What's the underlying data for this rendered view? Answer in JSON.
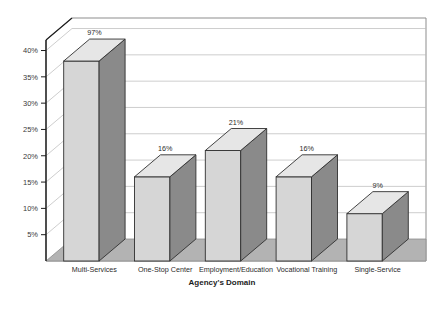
{
  "chart_data": {
    "type": "bar",
    "title": "",
    "xlabel": "Agency's Domain",
    "ylabel": "",
    "categories": [
      "Multi-Services",
      "One-Stop Center",
      "Employment/Education",
      "Vocational Training",
      "Single-Service"
    ],
    "values": [
      38,
      16,
      21,
      16,
      9
    ],
    "data_labels": [
      "97%",
      "16%",
      "21%",
      "16%",
      "9%"
    ],
    "ytick_labels": [
      "5%",
      "10%",
      "15%",
      "20%",
      "25%",
      "30%",
      "35%",
      "40%"
    ],
    "ytick_values": [
      5,
      10,
      15,
      20,
      25,
      30,
      35,
      40
    ],
    "ylim": [
      0,
      42
    ],
    "grid": true,
    "legend": "none",
    "style": "3d-bar",
    "colors": {
      "bar_front": "#d6d6d6",
      "bar_side": "#8a8a8a",
      "bar_top": "#e6e6e6",
      "bar_outline": "#303030",
      "floor": "#b3b3b3",
      "grid_line": "#b8b8b8",
      "axis_line": "#1c1c1c",
      "frame": "#6e6e6e",
      "background": "#ffffff",
      "text": "#2b2b2b"
    }
  }
}
